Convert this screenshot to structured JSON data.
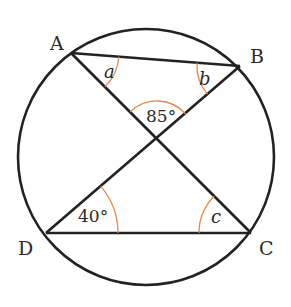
{
  "diagram": {
    "type": "circle-geometry",
    "colors": {
      "line": "#222222",
      "arc": "#e8874a",
      "text": "#2a2a2a",
      "background": "#ffffff"
    },
    "circle": {
      "cx": 146,
      "cy": 157,
      "r": 128
    },
    "points": {
      "A": {
        "label": "A",
        "x": 71,
        "y": 53
      },
      "B": {
        "label": "B",
        "x": 240,
        "y": 66
      },
      "C": {
        "label": "C",
        "x": 251,
        "y": 233
      },
      "D": {
        "label": "D",
        "x": 46,
        "y": 233
      },
      "X": {
        "x": 157,
        "y": 139
      }
    },
    "segments": [
      {
        "from": "A",
        "to": "B"
      },
      {
        "from": "A",
        "to": "C"
      },
      {
        "from": "B",
        "to": "D"
      },
      {
        "from": "D",
        "to": "C"
      }
    ],
    "angles": {
      "a": {
        "label": "a",
        "vertex": "A",
        "italic": true
      },
      "b": {
        "label": "b",
        "vertex": "B",
        "italic": true
      },
      "center": {
        "label": "85°",
        "vertex": "X"
      },
      "d": {
        "label": "40°",
        "vertex": "D"
      },
      "c": {
        "label": "c",
        "vertex": "C",
        "italic": true
      }
    }
  }
}
